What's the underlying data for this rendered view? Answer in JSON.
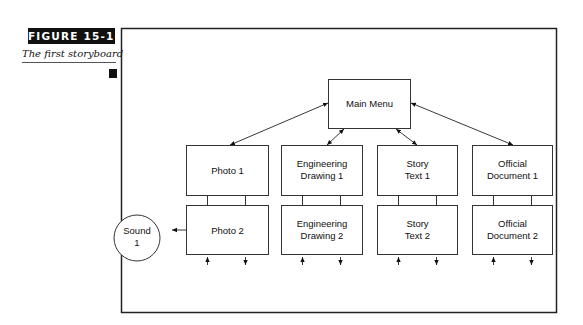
{
  "figure": {
    "label": "FIGURE 15-11",
    "caption": "The first storyboard"
  },
  "diagram": {
    "main_menu": {
      "label": "Main Menu"
    },
    "row1": [
      {
        "line1": "Photo 1",
        "line2": ""
      },
      {
        "line1": "Engineering",
        "line2": "Drawing 1"
      },
      {
        "line1": "Story",
        "line2": "Text 1"
      },
      {
        "line1": "Official",
        "line2": "Document 1"
      }
    ],
    "row2": [
      {
        "line1": "Photo 2",
        "line2": ""
      },
      {
        "line1": "Engineering",
        "line2": "Drawing 2"
      },
      {
        "line1": "Story",
        "line2": "Text 2"
      },
      {
        "line1": "Official",
        "line2": "Document 2"
      }
    ],
    "sound": {
      "line1": "Sound",
      "line2": "1"
    }
  }
}
